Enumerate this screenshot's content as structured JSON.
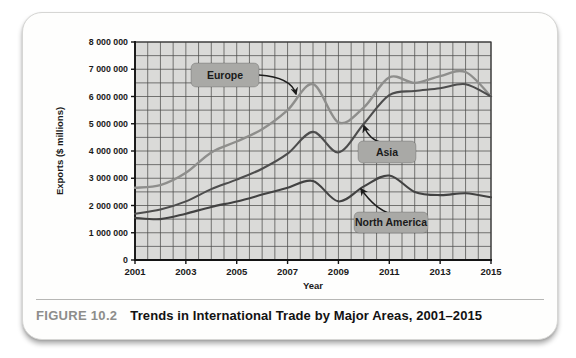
{
  "figure": {
    "label": "FIGURE 10.2",
    "title": "Trends in International Trade by Major Areas, 2001–2015"
  },
  "chart_data": {
    "type": "line",
    "title": "Trends in International Trade by Major Areas, 2001–2015",
    "xlabel": "Year",
    "ylabel": "Exports ($ millions)",
    "xlim": [
      2001,
      2015
    ],
    "ylim": [
      0,
      8000000
    ],
    "grid": {
      "on": true,
      "x_minor_step_years": 0.5,
      "y_minor_step": 500000
    },
    "x_ticks": [
      2001,
      2003,
      2005,
      2007,
      2009,
      2011,
      2013,
      2015
    ],
    "x_tick_labels": [
      "2001",
      "2003",
      "2005",
      "2007",
      "2009",
      "2011",
      "2013",
      "2015"
    ],
    "y_ticks": [
      0,
      1000000,
      2000000,
      3000000,
      4000000,
      5000000,
      6000000,
      7000000,
      8000000
    ],
    "y_tick_labels": [
      "0",
      "1 000 000",
      "2 000 000",
      "3 000 000",
      "4 000 000",
      "5 000 000",
      "6 000 000",
      "7 000 000",
      "8 000 000"
    ],
    "x": [
      2001,
      2002,
      2003,
      2004,
      2005,
      2006,
      2007,
      2008,
      2009,
      2010,
      2011,
      2012,
      2013,
      2014,
      2015
    ],
    "series": [
      {
        "name": "Europe",
        "color": "#8e8e8c",
        "width": 2.4,
        "values": [
          2650000,
          2750000,
          3200000,
          3950000,
          4350000,
          4800000,
          5500000,
          6450000,
          5050000,
          5600000,
          6700000,
          6500000,
          6750000,
          6900000,
          6000000
        ]
      },
      {
        "name": "Asia",
        "color": "#4d4d4d",
        "width": 2.1,
        "values": [
          1700000,
          1850000,
          2150000,
          2600000,
          2950000,
          3350000,
          3900000,
          4700000,
          3950000,
          5000000,
          6050000,
          6200000,
          6300000,
          6450000,
          6000000
        ]
      },
      {
        "name": "North America",
        "color": "#424242",
        "width": 2.1,
        "values": [
          1550000,
          1500000,
          1700000,
          1950000,
          2150000,
          2400000,
          2650000,
          2900000,
          2150000,
          2700000,
          3100000,
          2500000,
          2380000,
          2450000,
          2300000
        ]
      }
    ],
    "annotations": [
      {
        "label": "Europe",
        "box": {
          "x": 168,
          "y": 50,
          "w": 68,
          "h": 24
        },
        "arrow": {
          "from": [
            236,
            62
          ],
          "ctrl": [
            268,
            64
          ],
          "to": [
            273,
            81
          ]
        }
      },
      {
        "label": "Asia",
        "box": {
          "x": 335,
          "y": 128,
          "w": 58,
          "h": 22
        },
        "arrow": {
          "from": [
            360,
            130
          ],
          "ctrl": [
            346,
            127
          ],
          "to": [
            341,
            113
          ]
        }
      },
      {
        "label": "North America",
        "box": {
          "x": 331,
          "y": 199,
          "w": 74,
          "h": 21
        },
        "arrow": {
          "from": [
            368,
            201
          ],
          "ctrl": [
            352,
            196
          ],
          "to": [
            338,
            176
          ]
        }
      }
    ],
    "annotation_style": {
      "box_fill": "#a9a9a6",
      "box_text": "#161616",
      "arrow_color": "#1c1c1c"
    },
    "plot_style": {
      "bg": "#dadad8",
      "grid_color": "#4e4e4c",
      "frame_color": "#3a3a3a",
      "axis_color": "#141414"
    }
  }
}
